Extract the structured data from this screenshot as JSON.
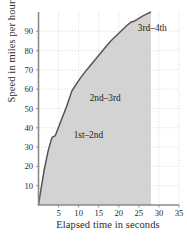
{
  "chart_data": {
    "type": "area",
    "title": "",
    "xlabel": "Elapsed time in seconds",
    "ylabel": "Speed in miles per hour",
    "xlim": [
      0,
      35
    ],
    "ylim": [
      0,
      100
    ],
    "xticks": [
      5,
      10,
      15,
      20,
      25,
      30,
      35
    ],
    "yticks": [
      10,
      20,
      30,
      40,
      50,
      60,
      70,
      80,
      90
    ],
    "grid": true,
    "legend": "none",
    "series": [
      {
        "name": "Speed",
        "x": [
          0,
          0.6,
          1.4,
          2.4,
          3.2,
          3.4,
          4.2,
          5.5,
          7.0,
          8.3,
          8.9,
          9.2,
          10.5,
          12.0,
          14.0,
          16.0,
          18.0,
          20.0,
          22.0,
          23.2,
          23.6,
          24.5,
          26.0,
          27.0,
          28.0
        ],
        "y": [
          0,
          8,
          18,
          28,
          34,
          35,
          36,
          43,
          51,
          59,
          61,
          62,
          66,
          70,
          75,
          80,
          85,
          89,
          93,
          95,
          95,
          96,
          98,
          99,
          100
        ]
      }
    ],
    "shaded_region": {
      "fill_color": "#d3d3d3",
      "x_start": 0,
      "x_end": 28
    },
    "line_color": "#555555",
    "grid_color": "#c9c9c9",
    "axis_color": "#8a8a8a",
    "annotations": [
      {
        "text": "1st–2nd",
        "x": 9.0,
        "y": 36
      },
      {
        "text": "2nd–3rd",
        "x": 13.0,
        "y": 55
      },
      {
        "text": "3rd–4th",
        "x": 25.0,
        "y": 91
      }
    ]
  }
}
